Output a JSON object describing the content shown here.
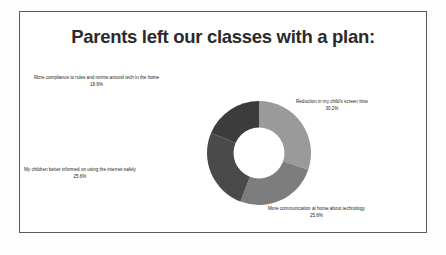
{
  "chart_data": {
    "type": "pie",
    "variant": "donut",
    "title": "Parents left our classes with a plan:",
    "xlabel": "",
    "ylabel": "",
    "legend_position": "outside-labels",
    "grid": false,
    "unit": "%",
    "start_angle_deg": 0,
    "direction": "clockwise",
    "categories": [
      "Reduction in my child's screen time",
      "More communication at home about technology",
      "My children better informed on using the internet safely",
      "More compliance to rules and norms around tech in the home"
    ],
    "values": [
      30.2,
      25.6,
      25.6,
      18.6
    ],
    "value_labels": [
      "30.2%",
      "25.6%",
      "25.6%",
      "18.6%"
    ],
    "colors": [
      "#9a9a9a",
      "#7d7d7d",
      "#4a4a4a",
      "#3c3c3c"
    ],
    "slices": [
      {
        "label": "Reduction in my child's screen time",
        "value": 30.2,
        "value_label": "30.2%",
        "color": "#9a9a9a",
        "position": "right"
      },
      {
        "label": "More communication at home about technology",
        "value": 25.6,
        "value_label": "25.6%",
        "color": "#7d7d7d",
        "position": "bottom-right"
      },
      {
        "label": "My children better informed on using the internet safely",
        "value": 25.6,
        "value_label": "25.6%",
        "color": "#4a4a4a",
        "position": "left"
      },
      {
        "label": "More compliance to rules and norms around tech in the home",
        "value": 18.6,
        "value_label": "18.6%",
        "color": "#3c3c3c",
        "position": "top-left"
      }
    ]
  },
  "slide": {
    "title": "Parents left our classes with a plan:",
    "border_color": "#5a5a5a",
    "background": "#ffffff"
  },
  "labels": {
    "compliance": {
      "text": "More compliance to rules and norms around tech in the home",
      "pct": "18.6%"
    },
    "screentime": {
      "text": "Reduction in my child's screen time",
      "pct": "30.2%"
    },
    "internet": {
      "text": "My children better informed on using the internet safely",
      "pct": "25.6%"
    },
    "communication": {
      "text": "More communication at home about technology",
      "pct": "25.6%"
    }
  }
}
